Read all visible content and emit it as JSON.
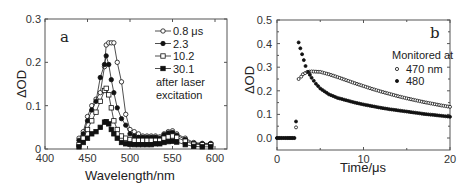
{
  "chart_data": [
    {
      "type": "line",
      "panel": "a",
      "title": "",
      "xlabel": "Wavelength/nm",
      "ylabel": "ΔOD",
      "xlim": [
        400,
        600
      ],
      "ylim": [
        0,
        0.3
      ],
      "xticks": [
        400,
        450,
        500,
        550,
        600
      ],
      "xtick_labels": [
        "400",
        "450",
        "500",
        "550",
        "600"
      ],
      "yticks": [
        0,
        0.1,
        0.2,
        0.3
      ],
      "ytick_labels": [
        "0",
        "0.1",
        "0.2",
        "0.3"
      ],
      "grid": false,
      "legend_position": "top-right",
      "legend_note": [
        "after laser",
        "excitation"
      ],
      "x": [
        440,
        445,
        450,
        455,
        460,
        465,
        470,
        472,
        475,
        478,
        481,
        485,
        490,
        495,
        500,
        505,
        510,
        515,
        520,
        525,
        530,
        535,
        540,
        545,
        550,
        555,
        565,
        575,
        585,
        595
      ],
      "series": [
        {
          "name": "0.8 μs",
          "marker": "open-circle",
          "values": [
            0.025,
            0.04,
            0.075,
            0.1,
            0.115,
            0.13,
            0.19,
            0.24,
            0.245,
            0.245,
            0.245,
            0.2,
            0.155,
            0.08,
            0.045,
            0.04,
            0.035,
            0.03,
            0.03,
            0.03,
            0.03,
            0.028,
            0.035,
            0.04,
            0.042,
            0.035,
            0.025,
            0.015,
            0.013,
            0.013
          ]
        },
        {
          "name": "2.3",
          "marker": "filled-circle",
          "values": [
            0.02,
            0.035,
            0.065,
            0.09,
            0.11,
            0.165,
            0.195,
            0.215,
            0.195,
            0.16,
            0.13,
            0.095,
            0.07,
            0.055,
            0.035,
            0.03,
            0.027,
            0.027,
            0.027,
            0.027,
            0.027,
            0.025,
            0.033,
            0.037,
            0.038,
            0.032,
            0.022,
            0.013,
            0.012,
            0.012
          ]
        },
        {
          "name": "10.2",
          "marker": "open-square",
          "values": [
            0.01,
            0.025,
            0.045,
            0.065,
            0.085,
            0.11,
            0.135,
            0.14,
            0.125,
            0.095,
            0.065,
            0.045,
            0.03,
            0.025,
            0.022,
            0.02,
            0.02,
            0.02,
            0.02,
            0.02,
            0.02,
            0.02,
            0.025,
            0.028,
            0.03,
            0.027,
            0.018,
            0.011,
            0.01,
            0.01
          ]
        },
        {
          "name": "30.1",
          "marker": "filled-square",
          "values": [
            0.005,
            0.015,
            0.025,
            0.035,
            0.04,
            0.05,
            0.062,
            0.063,
            0.058,
            0.045,
            0.035,
            0.025,
            0.015,
            0.012,
            0.011,
            0.01,
            0.01,
            0.01,
            0.01,
            0.01,
            0.012,
            0.012,
            0.015,
            0.017,
            0.018,
            0.016,
            0.01,
            0.006,
            0.005,
            0.005
          ]
        }
      ]
    },
    {
      "type": "scatter",
      "panel": "b",
      "title": "",
      "xlabel": "Time/μs",
      "ylabel": "ΔOD",
      "xlim": [
        0,
        20
      ],
      "ylim": [
        0,
        0.5
      ],
      "xticks": [
        0,
        10,
        20
      ],
      "xtick_labels": [
        "0",
        "10",
        "20"
      ],
      "yticks": [
        0.0,
        0.1,
        0.2,
        0.3,
        0.4,
        0.5
      ],
      "ytick_labels": [
        "0.0",
        "0.1",
        "0.2",
        "0.3",
        "0.4",
        "0.5"
      ],
      "grid": false,
      "legend_position": "top-right",
      "legend_title": "Monitored at",
      "series": [
        {
          "name": "470 nm",
          "marker": "open-circle",
          "points": [
            [
              0,
              0
            ],
            [
              0.5,
              0
            ],
            [
              1,
              0
            ],
            [
              1.5,
              0
            ],
            [
              2,
              0
            ],
            [
              2.2,
              0.045
            ],
            [
              2.5,
              0.25
            ],
            [
              2.8,
              0.26
            ],
            [
              3,
              0.27
            ],
            [
              3.5,
              0.28
            ],
            [
              4,
              0.282
            ],
            [
              5,
              0.28
            ],
            [
              6,
              0.27
            ],
            [
              7,
              0.258
            ],
            [
              8,
              0.245
            ],
            [
              9,
              0.232
            ],
            [
              10,
              0.22
            ],
            [
              11,
              0.208
            ],
            [
              12,
              0.197
            ],
            [
              13,
              0.187
            ],
            [
              14,
              0.177
            ],
            [
              15,
              0.168
            ],
            [
              16,
              0.16
            ],
            [
              17,
              0.152
            ],
            [
              18,
              0.145
            ],
            [
              19,
              0.138
            ],
            [
              20,
              0.132
            ]
          ]
        },
        {
          "name": "480",
          "marker": "filled-circle",
          "points": [
            [
              0,
              0
            ],
            [
              0.5,
              0
            ],
            [
              1,
              0
            ],
            [
              1.5,
              0
            ],
            [
              2,
              0
            ],
            [
              2.2,
              0.07
            ],
            [
              2.5,
              0.405
            ],
            [
              2.7,
              0.38
            ],
            [
              2.9,
              0.355
            ],
            [
              3.1,
              0.33
            ],
            [
              3.3,
              0.305
            ],
            [
              3.6,
              0.28
            ],
            [
              4,
              0.255
            ],
            [
              4.5,
              0.23
            ],
            [
              5,
              0.21
            ],
            [
              6,
              0.185
            ],
            [
              7,
              0.17
            ],
            [
              8,
              0.16
            ],
            [
              9,
              0.15
            ],
            [
              10,
              0.142
            ],
            [
              11,
              0.135
            ],
            [
              12,
              0.128
            ],
            [
              13,
              0.122
            ],
            [
              14,
              0.117
            ],
            [
              15,
              0.112
            ],
            [
              16,
              0.107
            ],
            [
              17,
              0.102
            ],
            [
              18,
              0.098
            ],
            [
              19,
              0.094
            ],
            [
              20,
              0.09
            ]
          ]
        }
      ]
    }
  ],
  "labels": {
    "panel_a_letter": "a",
    "panel_b_letter": "b"
  }
}
